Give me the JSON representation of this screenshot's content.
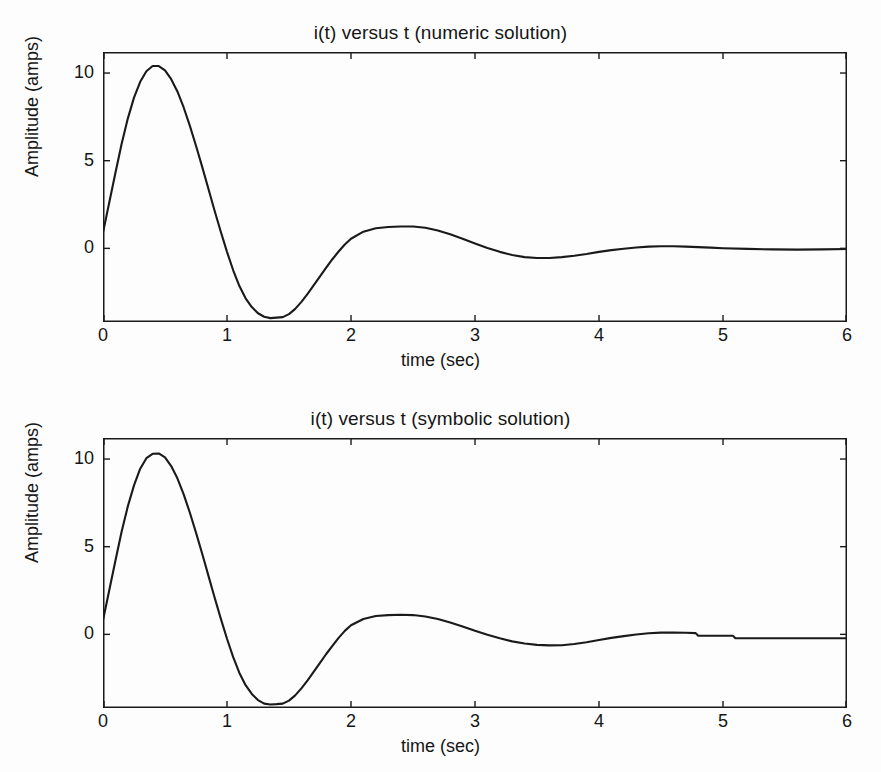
{
  "figure": {
    "background": "#fdfdfd",
    "axis_color": "#1a1a1a",
    "line_color": "#1a1a1a"
  },
  "panels": [
    {
      "id": "numeric",
      "title": "i(t) versus t (numeric solution)",
      "xlabel": "time (sec)",
      "ylabel": "Amplitude (amps)"
    },
    {
      "id": "symbolic",
      "title": "i(t) versus t (symbolic solution)",
      "xlabel": "time (sec)",
      "ylabel": "Amplitude (amps)"
    }
  ],
  "chart_data": [
    {
      "type": "line",
      "title": "i(t) versus t (numeric solution)",
      "xlabel": "time (sec)",
      "ylabel": "Amplitude (amps)",
      "xlim": [
        0,
        6
      ],
      "ylim": [
        -4.2,
        11.2
      ],
      "xticks": [
        0,
        1,
        2,
        3,
        4,
        5,
        6
      ],
      "xtick_labels": [
        "0",
        "1",
        "2",
        "3",
        "4",
        "5",
        "6"
      ],
      "yticks": [
        0,
        5,
        10
      ],
      "ytick_labels": [
        "0",
        "5",
        "10"
      ],
      "grid": false,
      "legend": "none",
      "box": true,
      "tick_direction": "in",
      "series": [
        {
          "name": "i(t) numeric",
          "color": "#1a1a1a",
          "x": [
            0.0,
            0.05,
            0.1,
            0.15,
            0.2,
            0.25,
            0.3,
            0.35,
            0.4,
            0.45,
            0.5,
            0.55,
            0.6,
            0.65,
            0.7,
            0.75,
            0.8,
            0.85,
            0.9,
            0.95,
            1.0,
            1.05,
            1.1,
            1.15,
            1.2,
            1.25,
            1.3,
            1.35,
            1.4,
            1.45,
            1.5,
            1.55,
            1.6,
            1.65,
            1.7,
            1.75,
            1.8,
            1.85,
            1.9,
            1.95,
            2.0,
            2.1,
            2.2,
            2.3,
            2.4,
            2.5,
            2.6,
            2.7,
            2.8,
            2.9,
            3.0,
            3.1,
            3.2,
            3.3,
            3.4,
            3.5,
            3.6,
            3.7,
            3.8,
            3.9,
            4.0,
            4.1,
            4.2,
            4.3,
            4.4,
            4.5,
            4.6,
            4.7,
            4.8,
            4.9,
            5.0,
            5.2,
            5.4,
            5.6,
            5.8,
            6.0
          ],
          "y": [
            0.9,
            2.6,
            4.3,
            5.95,
            7.4,
            8.6,
            9.5,
            10.1,
            10.4,
            10.4,
            10.15,
            9.65,
            8.95,
            8.05,
            7.0,
            5.85,
            4.65,
            3.4,
            2.15,
            0.95,
            -0.2,
            -1.25,
            -2.15,
            -2.85,
            -3.35,
            -3.7,
            -3.9,
            -3.98,
            -3.95,
            -3.92,
            -3.75,
            -3.45,
            -3.05,
            -2.6,
            -2.1,
            -1.6,
            -1.1,
            -0.62,
            -0.18,
            0.22,
            0.55,
            0.95,
            1.15,
            1.22,
            1.25,
            1.25,
            1.18,
            1.02,
            0.8,
            0.55,
            0.28,
            0.02,
            -0.2,
            -0.38,
            -0.5,
            -0.55,
            -0.55,
            -0.5,
            -0.42,
            -0.32,
            -0.2,
            -0.1,
            -0.02,
            0.05,
            0.1,
            0.12,
            0.12,
            0.1,
            0.07,
            0.04,
            0.01,
            -0.03,
            -0.06,
            -0.07,
            -0.06,
            -0.04
          ]
        }
      ],
      "notes": "Damped oscillatory RLC current response; peak approx 10.4 A near t=0.42 s, trough approx -3.95 A near t=1.45 s, second peak approx 1.25 A near t=2.5 s, settling toward 0 A."
    },
    {
      "type": "line",
      "title": "i(t) versus t (symbolic solution)",
      "xlabel": "time (sec)",
      "ylabel": "Amplitude (amps)",
      "xlim": [
        0,
        6
      ],
      "ylim": [
        -4.2,
        11.2
      ],
      "xticks": [
        0,
        1,
        2,
        3,
        4,
        5,
        6
      ],
      "xtick_labels": [
        "0",
        "1",
        "2",
        "3",
        "4",
        "5",
        "6"
      ],
      "yticks": [
        0,
        5,
        10
      ],
      "ytick_labels": [
        "0",
        "5",
        "10"
      ],
      "grid": false,
      "legend": "none",
      "box": true,
      "tick_direction": "in",
      "series": [
        {
          "name": "i(t) symbolic",
          "color": "#1a1a1a",
          "x": [
            0.0,
            0.05,
            0.1,
            0.15,
            0.2,
            0.25,
            0.3,
            0.35,
            0.4,
            0.45,
            0.5,
            0.55,
            0.6,
            0.65,
            0.7,
            0.75,
            0.8,
            0.85,
            0.9,
            0.95,
            1.0,
            1.05,
            1.1,
            1.15,
            1.2,
            1.25,
            1.3,
            1.35,
            1.4,
            1.45,
            1.5,
            1.55,
            1.6,
            1.65,
            1.7,
            1.75,
            1.8,
            1.85,
            1.9,
            1.95,
            2.0,
            2.1,
            2.2,
            2.3,
            2.4,
            2.5,
            2.6,
            2.7,
            2.8,
            2.9,
            3.0,
            3.1,
            3.2,
            3.3,
            3.4,
            3.5,
            3.6,
            3.7,
            3.8,
            3.9,
            4.0,
            4.1,
            4.2,
            4.3,
            4.4,
            4.5,
            4.6,
            4.7,
            4.78,
            4.8,
            5.08,
            5.1,
            5.4,
            5.7,
            6.0
          ],
          "y": [
            0.8,
            2.5,
            4.2,
            5.85,
            7.3,
            8.5,
            9.45,
            10.05,
            10.3,
            10.32,
            10.1,
            9.6,
            8.9,
            8.0,
            6.95,
            5.8,
            4.6,
            3.35,
            2.1,
            0.9,
            -0.25,
            -1.3,
            -2.2,
            -2.9,
            -3.4,
            -3.75,
            -3.95,
            -4.0,
            -3.98,
            -3.95,
            -3.78,
            -3.48,
            -3.08,
            -2.62,
            -2.12,
            -1.62,
            -1.12,
            -0.65,
            -0.2,
            0.2,
            0.52,
            0.88,
            1.05,
            1.1,
            1.12,
            1.1,
            1.02,
            0.88,
            0.68,
            0.45,
            0.2,
            -0.02,
            -0.22,
            -0.4,
            -0.52,
            -0.6,
            -0.63,
            -0.62,
            -0.55,
            -0.45,
            -0.32,
            -0.2,
            -0.1,
            -0.01,
            0.06,
            0.1,
            0.11,
            0.09,
            0.07,
            -0.08,
            -0.08,
            -0.22,
            -0.22,
            -0.22,
            -0.22
          ]
        }
      ],
      "notes": "Same damped oscillation as the numeric panel, reproduced from the symbolic closed-form expression. Scanned tail shows two small step discontinuities near t=4.8 s and t=5.1 s."
    }
  ]
}
